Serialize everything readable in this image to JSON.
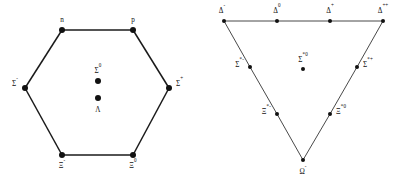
{
  "figure": {
    "background_color": "#ffffff",
    "line_color": "#1a1a1a",
    "dot_color": "#111111",
    "panels": [
      {
        "id": "baryon-octet",
        "shape": "hexagon",
        "vertices": [
          {
            "name": "n",
            "base": "n",
            "sup": "",
            "x": 62,
            "y": 30,
            "lx": 62,
            "ly": 22,
            "anchor": "middle"
          },
          {
            "name": "p",
            "base": "p",
            "sup": "",
            "x": 133,
            "y": 30,
            "lx": 133,
            "ly": 22,
            "anchor": "middle"
          },
          {
            "name": "Sigma+",
            "base": "Σ",
            "sup": "+",
            "x": 169,
            "y": 88,
            "lx": 176,
            "ly": 86,
            "anchor": "start"
          },
          {
            "name": "Xi0",
            "base": "Ξ",
            "sup": "0",
            "x": 133,
            "y": 155,
            "lx": 133,
            "ly": 168,
            "anchor": "middle"
          },
          {
            "name": "Xi-",
            "base": "Ξ",
            "sup": "-",
            "x": 62,
            "y": 155,
            "lx": 62,
            "ly": 168,
            "anchor": "middle"
          },
          {
            "name": "Sigma-",
            "base": "Σ",
            "sup": "-",
            "x": 25,
            "y": 88,
            "lx": 18,
            "ly": 86,
            "anchor": "end"
          }
        ],
        "interior_points": [
          {
            "name": "Sigma0",
            "base": "Σ",
            "sup": "0",
            "x": 98,
            "y": 81,
            "lx": 98,
            "ly": 73,
            "anchor": "middle",
            "label_pos": "above"
          },
          {
            "name": "Lambda",
            "base": "Λ",
            "sup": "",
            "x": 98,
            "y": 98,
            "lx": 98,
            "ly": 112,
            "anchor": "middle",
            "label_pos": "below"
          }
        ]
      },
      {
        "id": "baryon-decuplet",
        "shape": "triangle",
        "vertices": [
          {
            "name": "Delta-",
            "base": "Δ",
            "sup": "-",
            "x": 224,
            "y": 21,
            "lx": 222,
            "ly": 13,
            "anchor": "middle"
          },
          {
            "name": "Delta0",
            "base": "Δ",
            "sup": "0",
            "x": 277,
            "y": 21,
            "lx": 277,
            "ly": 13,
            "anchor": "middle"
          },
          {
            "name": "Delta+",
            "base": "Δ",
            "sup": "+",
            "x": 330,
            "y": 21,
            "lx": 330,
            "ly": 13,
            "anchor": "middle"
          },
          {
            "name": "Delta++",
            "base": "Δ",
            "sup": "++",
            "x": 383,
            "y": 21,
            "lx": 383,
            "ly": 13,
            "anchor": "middle"
          },
          {
            "name": "Sigma*+",
            "base": "Σ",
            "sup": "*+",
            "x": 357,
            "y": 67,
            "lx": 363,
            "ly": 67,
            "anchor": "start"
          },
          {
            "name": "Xi*0",
            "base": "Ξ",
            "sup": "*0",
            "x": 330,
            "y": 114,
            "lx": 336,
            "ly": 114,
            "anchor": "start"
          },
          {
            "name": "Omega-",
            "base": "Ω",
            "sup": "-",
            "x": 303,
            "y": 160,
            "lx": 303,
            "ly": 174,
            "anchor": "middle"
          },
          {
            "name": "Xi*-",
            "base": "Ξ",
            "sup": "*-",
            "x": 277,
            "y": 114,
            "lx": 271,
            "ly": 114,
            "anchor": "end"
          },
          {
            "name": "Sigma*-",
            "base": "Σ",
            "sup": "*-",
            "x": 250,
            "y": 67,
            "lx": 244,
            "ly": 67,
            "anchor": "end"
          }
        ],
        "interior_points": [
          {
            "name": "Sigma*0",
            "base": "Σ",
            "sup": "*0",
            "x": 303,
            "y": 69,
            "lx": 303,
            "ly": 62,
            "anchor": "middle",
            "label_pos": "above"
          }
        ]
      }
    ]
  }
}
